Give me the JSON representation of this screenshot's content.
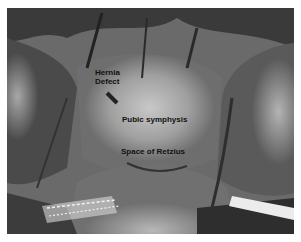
{
  "figure": {
    "type": "grayscale laparoscopic surgical photograph",
    "labels": {
      "hernia_line1": "Hernia",
      "hernia_line2": "Defect",
      "pubic": "Pubic symphysis",
      "retzius": "Space of Retzius"
    }
  }
}
